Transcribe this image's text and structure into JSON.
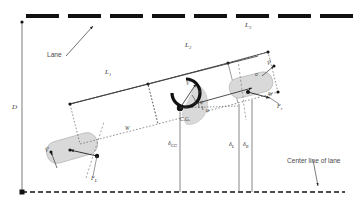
{
  "figure": {
    "type": "vehicle-lane-geometry-diagram",
    "background": "#ffffff",
    "ink": "#1a1a1a",
    "vehicle_fill": "#d9d9d9"
  },
  "annotations": {
    "lane": "Lane",
    "center_line": "Center line of lane",
    "lateral_offset_D": "D",
    "length_L1": "L",
    "length_L1_sub": "1",
    "length_L2": "L",
    "length_L2_sub": "2",
    "length_L3": "L",
    "length_L3_sub": "3",
    "cg": "C.G.",
    "delta_cg": "δ",
    "delta_cg_sub": "CG",
    "delta_left": "δ",
    "delta_left_sub": "L",
    "delta_right": "δ",
    "delta_right_sub": "R",
    "force_left": "F",
    "force_left_sub": "L",
    "force_right": "F",
    "force_right_sub": "r",
    "velocity_front": "V",
    "velocity_front_sup": "→",
    "velocity_rear": "V",
    "velocity_rear_sup": "→",
    "velocity_cg": "V",
    "velocity_cg_sup": "→",
    "angle_theta": "θ",
    "angle_psi": "ψ",
    "angle_phi": "φ",
    "angle_alpha": "α",
    "width_W_left": "W",
    "width_W_right": "W"
  },
  "lane_markers": {
    "count": 8,
    "color": "#111111",
    "dash_width": 33,
    "dash_height": 4,
    "y": 14,
    "x_positions": [
      26,
      68,
      110,
      152,
      194,
      236,
      278,
      320
    ]
  },
  "bottom_centerline": {
    "label": "center-line-of-lane",
    "y": 192,
    "style": "dashed",
    "color": "#111111"
  }
}
